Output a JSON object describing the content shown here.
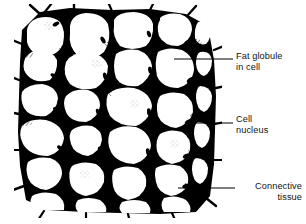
{
  "figure": {
    "name": "adipose-tissue-diagram",
    "background_color": "#ffffff",
    "ink_color": "#000000"
  },
  "labels": [
    {
      "id": "fat-globule",
      "line1": "Fat globule",
      "line2": "in cell",
      "align": "left",
      "leader": {
        "x1": 174,
        "y1": 59,
        "x2": 233,
        "y2": 59
      }
    },
    {
      "id": "cell-nucleus",
      "line1": "Cell",
      "line2": "nucleus",
      "align": "left",
      "leader": {
        "x1": 188,
        "y1": 123,
        "x2": 233,
        "y2": 123
      }
    },
    {
      "id": "connective-tissue",
      "line1": "Connective",
      "line2": "tissue",
      "align": "right",
      "leader": {
        "x1": 178,
        "y1": 188,
        "x2": 235,
        "y2": 188
      }
    }
  ],
  "drawing": {
    "cells_visible": 40,
    "nuclei_visible": 14,
    "membrane_stroke_width_px": 3,
    "region": {
      "x": 18,
      "y": 8,
      "width": 200,
      "height": 206
    }
  }
}
